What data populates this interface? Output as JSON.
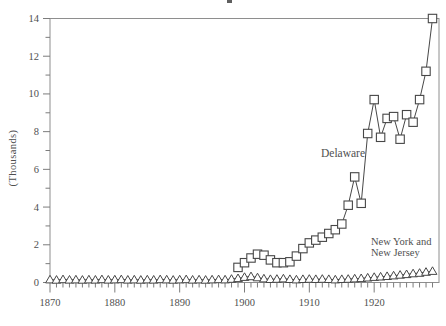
{
  "colors": {
    "background": "#ffffff",
    "frame": "#8e8e8e",
    "tick": "#7c7c7c",
    "ink": "#474747",
    "text": "#4f4f4f"
  },
  "chart_data": {
    "type": "line",
    "title": "",
    "xlabel": "",
    "ylabel": "(Thousands)",
    "grid": false,
    "x_axis": {
      "min": 1870,
      "max": 1930,
      "major_ticks": [
        1870,
        1880,
        1890,
        1900,
        1910,
        1920
      ],
      "minor_tick_step": 1,
      "minor_tick_last": 1929
    },
    "y_axis": {
      "min": 0,
      "max": 14,
      "major_ticks": [
        0,
        2,
        4,
        6,
        8,
        10,
        12,
        14
      ],
      "minor_ticks": [
        1,
        3,
        5,
        7,
        9,
        11,
        13
      ]
    },
    "series": [
      {
        "name": "Delaware",
        "marker": "square",
        "start_year": 1899,
        "values": [
          0.8,
          1.05,
          1.3,
          1.5,
          1.45,
          1.2,
          1.05,
          1.05,
          1.1,
          1.4,
          1.8,
          2.1,
          2.25,
          2.4,
          2.6,
          2.8,
          3.1,
          4.1,
          5.6,
          4.2,
          7.9,
          9.7,
          7.7,
          8.7,
          8.8,
          7.6,
          8.9,
          8.5,
          9.7,
          11.2,
          14.0
        ]
      },
      {
        "name": "New York and New Jersey",
        "marker": "triangle",
        "start_year": 1870,
        "values": [
          0.15,
          0.13,
          0.16,
          0.14,
          0.15,
          0.13,
          0.15,
          0.14,
          0.16,
          0.14,
          0.15,
          0.16,
          0.14,
          0.15,
          0.13,
          0.15,
          0.14,
          0.16,
          0.15,
          0.13,
          0.15,
          0.16,
          0.14,
          0.15,
          0.13,
          0.15,
          0.16,
          0.15,
          0.18,
          0.22,
          0.28,
          0.32,
          0.26,
          0.2,
          0.17,
          0.18,
          0.2,
          0.17,
          0.15,
          0.17,
          0.18,
          0.17,
          0.18,
          0.17,
          0.15,
          0.17,
          0.18,
          0.2,
          0.22,
          0.25,
          0.28,
          0.3,
          0.33,
          0.36,
          0.4,
          0.43,
          0.47,
          0.5,
          0.55,
          0.6
        ]
      }
    ],
    "annotations": [
      {
        "id": "delaware-label",
        "lines": [
          "Delaware"
        ]
      },
      {
        "id": "ny-nj-label",
        "lines": [
          "New York and",
          "New Jersey"
        ]
      }
    ]
  }
}
